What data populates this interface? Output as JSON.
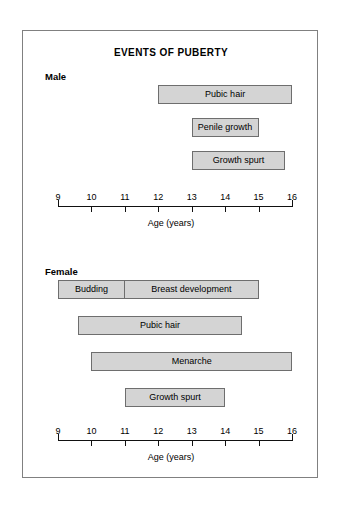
{
  "chart_data": {
    "type": "bar",
    "orientation": "horizontal",
    "title": "EVENTS OF PUBERTY",
    "xlabel": "Age (years)",
    "ylabel": "",
    "xlim": [
      9,
      16
    ],
    "grid": false,
    "legend": "none",
    "tick_labels": [
      "9",
      "10",
      "11",
      "12",
      "13",
      "14",
      "15",
      "16"
    ],
    "ticks": [
      9,
      10,
      11,
      12,
      13,
      14,
      15,
      16
    ],
    "panels": [
      {
        "name": "Male",
        "label": "Male",
        "axis_caption": "Age (years)",
        "bars": [
          {
            "label": "Pubic hair",
            "start": 12.0,
            "end": 16.0
          },
          {
            "label": "Penile growth",
            "start": 13.0,
            "end": 15.0
          },
          {
            "label": "Growth spurt",
            "start": 13.0,
            "end": 15.8
          }
        ]
      },
      {
        "name": "Female",
        "label": "Female",
        "axis_caption": "Age (years)",
        "bars": [
          {
            "label": "Breast development",
            "start": 9.0,
            "end": 15.0,
            "segments": [
              {
                "label": "Budding",
                "start": 9.0,
                "end": 11.0
              },
              {
                "label": "Breast development",
                "start": 11.0,
                "end": 15.0
              }
            ]
          },
          {
            "label": "Pubic hair",
            "start": 9.6,
            "end": 14.5
          },
          {
            "label": "Menarche",
            "start": 10.0,
            "end": 16.0
          },
          {
            "label": "Growth spurt",
            "start": 11.0,
            "end": 14.0
          }
        ]
      }
    ],
    "colors": {
      "bar_fill": "#d4d4d4",
      "bar_stroke": "#6e6e6e",
      "axis": "#111111",
      "frame": "#808080",
      "background": "#ffffff",
      "text": "#000000"
    }
  }
}
